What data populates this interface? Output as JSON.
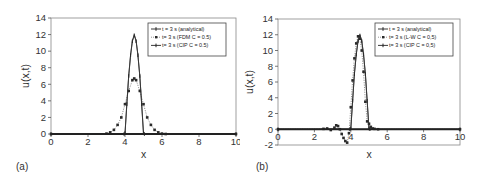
{
  "chart_data": [
    {
      "panel_label": "(a)",
      "type": "line",
      "title": "",
      "xlabel": "x",
      "ylabel": "u(x,t)",
      "xlim": [
        0,
        10
      ],
      "ylim": [
        0,
        14
      ],
      "xticks": [
        0,
        2,
        4,
        6,
        8,
        10
      ],
      "yticks": [
        0,
        2,
        4,
        6,
        8,
        10,
        12,
        14
      ],
      "grid": false,
      "legend_position": "upper right",
      "series": [
        {
          "name": "t = 3 s (analytical)",
          "style": "solid-thin",
          "x": [
            0,
            3.95,
            4.0,
            4.1,
            4.2,
            4.3,
            4.4,
            4.5,
            4.6,
            4.7,
            4.8,
            4.9,
            5.0,
            5.05,
            10
          ],
          "y": [
            0,
            0,
            0,
            3.5,
            7.0,
            9.6,
            11.3,
            12.0,
            11.3,
            9.6,
            7.0,
            3.5,
            0,
            0,
            0
          ]
        },
        {
          "name": "t= 3 s (FDM C = 0.5)",
          "style": "dotted-markers",
          "x": [
            0,
            3.0,
            3.2,
            3.4,
            3.6,
            3.8,
            4.0,
            4.2,
            4.4,
            4.5,
            4.6,
            4.8,
            5.0,
            5.2,
            5.4,
            5.6,
            5.8,
            6.0,
            6.2,
            10
          ],
          "y": [
            0,
            0.05,
            0.2,
            0.5,
            1.1,
            2.0,
            3.6,
            5.2,
            6.5,
            6.7,
            6.5,
            5.2,
            3.6,
            2.0,
            1.1,
            0.5,
            0.2,
            0.05,
            0,
            0
          ]
        },
        {
          "name": "t= 3 s (CIP C = 0.5)",
          "style": "solid-markers",
          "x": [
            0,
            3.95,
            4.0,
            4.1,
            4.2,
            4.3,
            4.4,
            4.5,
            4.6,
            4.7,
            4.8,
            4.9,
            5.0,
            5.05,
            10
          ],
          "y": [
            0,
            0,
            0.1,
            3.6,
            7.0,
            9.5,
            11.2,
            11.9,
            11.2,
            9.5,
            7.0,
            3.6,
            0.1,
            0,
            0
          ]
        }
      ]
    },
    {
      "panel_label": "(b)",
      "type": "line",
      "title": "",
      "xlabel": "x",
      "ylabel": "u(x,t)",
      "xlim": [
        0,
        10
      ],
      "ylim": [
        -2,
        14
      ],
      "xticks": [
        0,
        2,
        4,
        6,
        8,
        10
      ],
      "yticks": [
        -2,
        0,
        2,
        4,
        6,
        8,
        10,
        12,
        14
      ],
      "grid": false,
      "legend_position": "upper right",
      "series": [
        {
          "name": "t = 3 s (analytical)",
          "style": "solid-thin",
          "x": [
            0,
            3.95,
            4.0,
            4.1,
            4.2,
            4.3,
            4.4,
            4.5,
            4.6,
            4.7,
            4.8,
            4.9,
            5.0,
            5.05,
            10
          ],
          "y": [
            0,
            0,
            0,
            3.5,
            7.0,
            9.6,
            11.3,
            12.0,
            11.3,
            9.6,
            7.0,
            3.5,
            0,
            0,
            0
          ]
        },
        {
          "name": "t= 3 s (L-W C = 0,5)",
          "style": "dotted-markers",
          "x": [
            0,
            2.5,
            2.7,
            2.9,
            3.1,
            3.2,
            3.3,
            3.4,
            3.5,
            3.6,
            3.7,
            3.8,
            3.9,
            4.0,
            4.1,
            4.2,
            4.3,
            4.4,
            4.5,
            4.6,
            4.7,
            4.8,
            4.9,
            5.0,
            5.1,
            5.2,
            5.3,
            5.5,
            10
          ],
          "y": [
            0,
            0.05,
            0.1,
            -0.1,
            0.2,
            0.5,
            0.4,
            0,
            -0.6,
            -1.1,
            -1.5,
            -1.7,
            -0.5,
            2.8,
            6.2,
            9.0,
            10.9,
            11.8,
            11.5,
            10.0,
            7.3,
            3.5,
            1.0,
            0.7,
            0.3,
            0.1,
            0.05,
            0,
            0
          ]
        },
        {
          "name": "t= 3 s (CIP C = 0,5)",
          "style": "solid-markers",
          "x": [
            0,
            3.95,
            4.0,
            4.1,
            4.2,
            4.3,
            4.4,
            4.5,
            4.6,
            4.7,
            4.8,
            4.9,
            5.0,
            5.05,
            10
          ],
          "y": [
            0,
            0,
            0.1,
            3.6,
            7.0,
            9.5,
            11.2,
            11.9,
            11.2,
            9.5,
            7.0,
            3.6,
            0.1,
            0,
            0
          ]
        }
      ]
    }
  ],
  "panels": {
    "a": {
      "label": "(a)",
      "xlabel": "x",
      "ylabel": "u(x,t)",
      "legend": [
        "t = 3 s (analytical)",
        "t= 3 s (FDM C = 0.5)",
        "t= 3 s (CIP C = 0.5)"
      ]
    },
    "b": {
      "label": "(b)",
      "xlabel": "x",
      "ylabel": "u(x,t)",
      "legend": [
        "t = 3 s (analytical)",
        "t= 3 s (L-W C = 0,5)",
        "t= 3 s (CIP C = 0,5)"
      ]
    }
  },
  "colors": {
    "axis": "#555555",
    "line": "#333333",
    "marker": "#2a2a2a",
    "legend_border": "#444444"
  }
}
